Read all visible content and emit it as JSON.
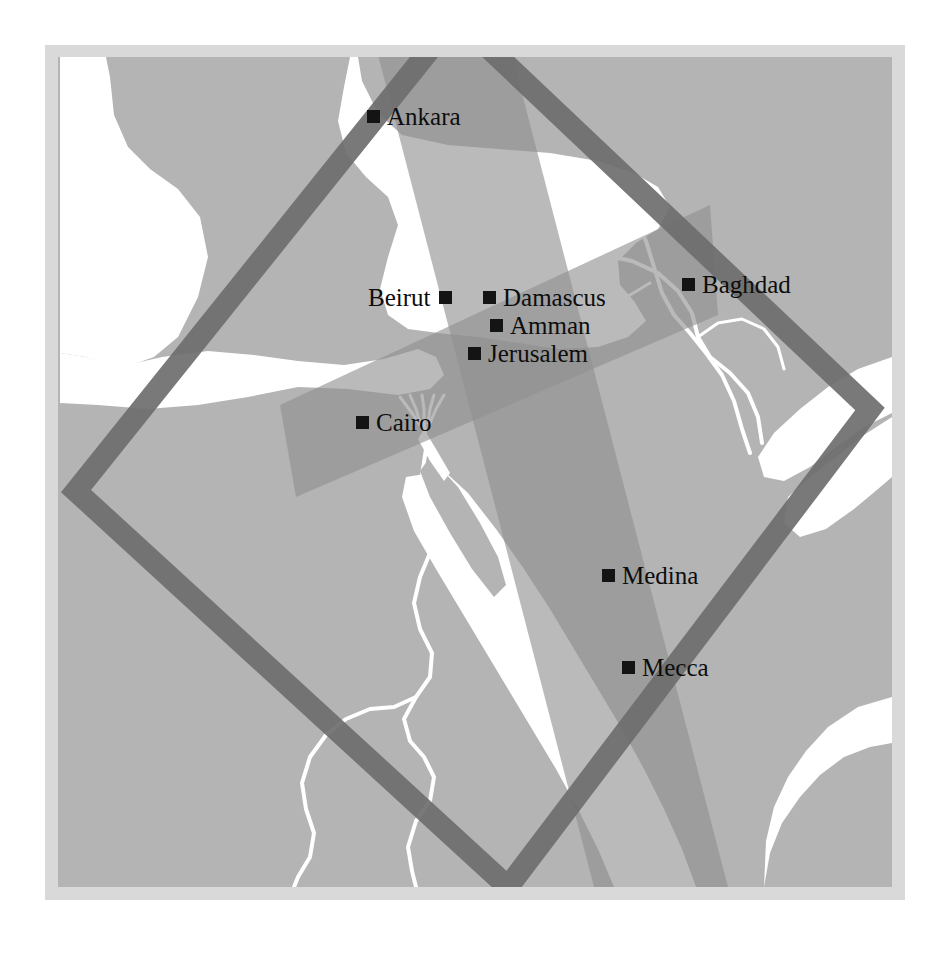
{
  "figure": {
    "type": "thematic-map",
    "region": "Middle East and Eastern Mediterranean",
    "width": 946,
    "height": 954
  },
  "colors": {
    "frame": "#d9d9d9",
    "land": "#b4b4b4",
    "sea": "#ffffff",
    "river": "#ffffff",
    "band_fill": "#8f8f8f",
    "diamond_stroke": "#6e6e6e",
    "label_text": "#0d0d0d",
    "marker": "#141414"
  },
  "cities": [
    {
      "name": "Ankara",
      "marker_side": "left",
      "x": 367,
      "y": 116
    },
    {
      "name": "Beirut",
      "marker_side": "right",
      "x": 368,
      "y": 297
    },
    {
      "name": "Damascus",
      "marker_side": "left",
      "x": 483,
      "y": 297
    },
    {
      "name": "Amman",
      "marker_side": "left",
      "x": 490,
      "y": 325
    },
    {
      "name": "Jerusalem",
      "marker_side": "left",
      "x": 468,
      "y": 353
    },
    {
      "name": "Baghdad",
      "marker_side": "left",
      "x": 682,
      "y": 284
    },
    {
      "name": "Cairo",
      "marker_side": "left",
      "x": 362,
      "y": 422
    },
    {
      "name": "Medina",
      "marker_side": "left",
      "x": 606,
      "y": 575
    },
    {
      "name": "Mecca",
      "marker_side": "left",
      "x": 626,
      "y": 667
    }
  ],
  "overlays": [
    {
      "id": "diamond-outline",
      "shape": "rotated-square-outline",
      "style": "dark gray stroke"
    },
    {
      "id": "band-vertical",
      "shape": "wide-translucent-band",
      "orientation": "north-northwest to south-southeast"
    },
    {
      "id": "band-horizontal",
      "shape": "wide-translucent-band",
      "orientation": "west-southwest to east-northeast"
    }
  ],
  "water_features": [
    "Mediterranean Sea",
    "Black Sea",
    "Aegean Sea",
    "Red Sea",
    "Persian Gulf",
    "Arabian Sea",
    "Nile River",
    "Tigris River",
    "Euphrates River"
  ]
}
